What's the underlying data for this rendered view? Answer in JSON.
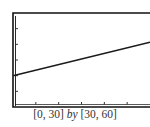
{
  "chart_data": {
    "type": "line",
    "title": "",
    "xlabel": "",
    "ylabel": "",
    "xlim": [
      0,
      30
    ],
    "ylim": [
      30,
      60
    ],
    "xscale": 5,
    "yscale": 5,
    "grid": false,
    "legend": null,
    "series": [
      {
        "name": "line",
        "x": [
          0,
          30
        ],
        "y": [
          40,
          50.7
        ]
      }
    ],
    "caption": {
      "xwindow": "[0, 30]",
      "by": "by",
      "ywindow": "[30, 60]"
    }
  },
  "colors": {
    "frame": "#111111",
    "line": "#1a1a1a",
    "tick": "#333333",
    "caption": "#333333"
  }
}
